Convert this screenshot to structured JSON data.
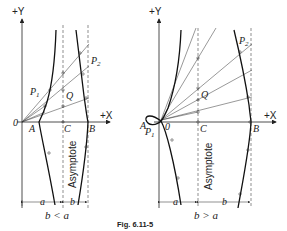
{
  "figure": {
    "caption": "Fig. 6.11-5"
  },
  "left_diagram": {
    "y_axis_label": "+Y",
    "x_axis_label": "+X",
    "origin_label": "0",
    "points": {
      "A": "A",
      "C": "C",
      "B": "B",
      "P1": "P",
      "P1_sub": "1",
      "P2": "P",
      "P2_sub": "2",
      "Q": "Q"
    },
    "asymptote_label": "Asymptote",
    "dim_a": "a",
    "dim_b": "b",
    "condition": "b < a"
  },
  "right_diagram": {
    "y_axis_label": "+Y",
    "x_axis_label": "+X",
    "origin_label": "0",
    "points": {
      "A": "A",
      "C": "C",
      "B": "B",
      "P1": "P",
      "P1_sub": "1",
      "P2": "P",
      "P2_sub": "2",
      "Q": "Q"
    },
    "asymptote_label": "Asymptote",
    "dim_a": "a",
    "dim_b": "b",
    "condition": "b > a"
  }
}
